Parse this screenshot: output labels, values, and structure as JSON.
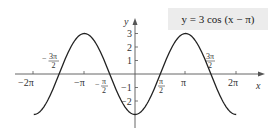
{
  "chart_data": {
    "type": "line",
    "title": "y = 3 cos (x − π)",
    "function": "y = 3 cos(x - pi)",
    "xlabel": "x",
    "ylabel": "y",
    "xlim": [
      -6.2832,
      6.2832
    ],
    "ylim": [
      -3,
      3
    ],
    "x_ticks": [
      "−2π",
      "−π",
      "π",
      "2π"
    ],
    "x_tick_values": [
      -6.2832,
      -3.1416,
      3.1416,
      6.2832
    ],
    "annotated_zeros": [
      "−3π/2",
      "−π/2",
      "π/2",
      "3π/2"
    ],
    "annotated_zero_values": [
      -4.7124,
      -1.5708,
      1.5708,
      4.7124
    ],
    "y_ticks": [
      3,
      2,
      1,
      -1,
      -2
    ],
    "series": [
      {
        "name": "y = 3 cos (x − π)",
        "color": "#222222",
        "x": [
          -6.2832,
          -4.7124,
          -3.1416,
          -1.5708,
          0,
          1.5708,
          3.1416,
          4.7124,
          6.2832
        ],
        "y": [
          -3,
          0,
          3,
          0,
          -3,
          0,
          3,
          0,
          -3
        ]
      }
    ],
    "grid": false,
    "legend": "none"
  },
  "labels": {
    "equation": "y = 3 cos (x − π)",
    "x_axis": "x",
    "y_axis": "y",
    "x_neg2pi": "−2π",
    "x_negpi": "−π",
    "x_pi": "π",
    "x_2pi": "2π",
    "neg3pi2_num": "3π",
    "neg_sign": "−",
    "den2": "2",
    "negpi2_num": "π",
    "pi2_num": "π",
    "pi32_num": "3π",
    "y3": "3",
    "y2": "2",
    "y1": "1",
    "ym1": "−1",
    "ym2": "−2"
  },
  "colors": {
    "curve": "#222222",
    "axis": "#555555",
    "equation_bg": "#ececec"
  }
}
